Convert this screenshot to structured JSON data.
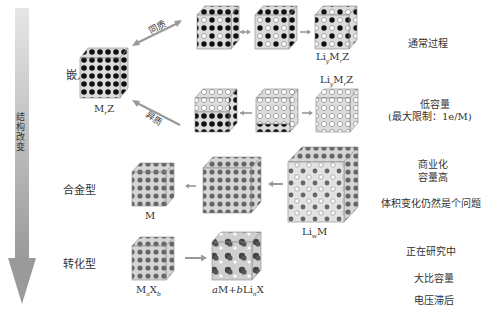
{
  "arrow": {
    "label": "结构改变"
  },
  "categories": {
    "insertion": "嵌入型",
    "alloy": "合金型",
    "conversion": "转化型"
  },
  "insertion": {
    "host_label": "MᵧZ",
    "host_label_parts": {
      "base": "M",
      "sub": "r",
      "tail": "Z"
    },
    "top_path_label": "同质",
    "bottom_path_label": "异质",
    "top_product": {
      "base1": "Li",
      "sub1": "y",
      "base2": "M",
      "sub2": "r",
      "tail": "Z"
    },
    "bottom_product": {
      "base1": "Li",
      "sub1": "y",
      "base2": "M",
      "sub2": "r",
      "tail": "Z"
    }
  },
  "alloy": {
    "host_label": "M",
    "product": {
      "base": "Li",
      "sub": "w",
      "tail": "M"
    }
  },
  "conversion": {
    "host": {
      "b1": "M",
      "s1": "a",
      "b2": "X",
      "s2": "b"
    },
    "product": {
      "a": "a",
      "m": "M+",
      "b": "b",
      "li": "Li",
      "n": "n",
      "x": "X"
    }
  },
  "notes": {
    "insertion_top": "通常过程",
    "insertion_bottom_1": "低容量",
    "insertion_bottom_2": "(最大限制：1e/M)",
    "alloy_1": "商业化",
    "alloy_2": "容量高",
    "alloy_3": "体积变化仍然是个问题",
    "conversion_1": "正在研究中",
    "conversion_2": "大比容量",
    "conversion_3": "电压滞后"
  },
  "colors": {
    "arrow_gray": "#a9a9a9",
    "cube_face": "#d8d8d8",
    "dot_black": "#111111",
    "dot_gray": "#555555"
  }
}
